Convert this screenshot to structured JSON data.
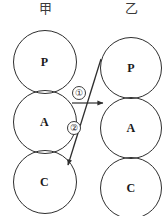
{
  "diagram": {
    "title_hidden": "",
    "columns": [
      {
        "id": "left",
        "header": "甲"
      },
      {
        "id": "right",
        "header": "乙"
      }
    ],
    "nodes": [
      {
        "id": "left-p",
        "column": "left",
        "label": "P",
        "cx": 44.5,
        "cy": 62,
        "r": 32
      },
      {
        "id": "left-a",
        "column": "left",
        "label": "A",
        "cx": 44.5,
        "cy": 122,
        "r": 32
      },
      {
        "id": "left-c",
        "column": "left",
        "label": "C",
        "cx": 44.5,
        "cy": 182,
        "r": 32
      },
      {
        "id": "right-p",
        "column": "right",
        "label": "P",
        "cx": 131,
        "cy": 68,
        "r": 31
      },
      {
        "id": "right-a",
        "column": "right",
        "label": "A",
        "cx": 131,
        "cy": 128,
        "r": 31
      },
      {
        "id": "right-c",
        "column": "right",
        "label": "C",
        "cx": 131,
        "cy": 188,
        "r": 31
      }
    ],
    "arrows": [
      {
        "id": "arrow-1",
        "label": "①",
        "from": "left-a",
        "to": "right-a",
        "shape": "horizontal",
        "x1": 72,
        "y1": 103,
        "x2": 103,
        "y2": 103
      },
      {
        "id": "arrow-2",
        "label": "②",
        "from": "right-p",
        "to": "left-c",
        "shape": "diagonal",
        "x1": 101,
        "y1": 59,
        "x2": 68,
        "y2": 165
      }
    ],
    "colors": {
      "background": "#ffffff",
      "stroke": "#2e2e2e",
      "text": "#1a1a1a",
      "header_text": "#3a3a3a"
    }
  }
}
